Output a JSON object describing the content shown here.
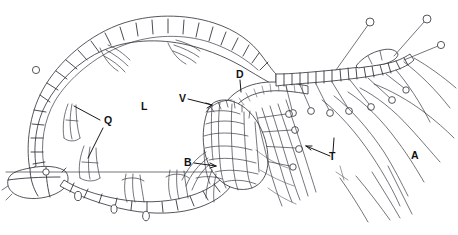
{
  "figure": {
    "background_color": "#ffffff",
    "ink_color": "#2b2b33",
    "label_color": "#101014",
    "width": 458,
    "height": 235
  },
  "labels": [
    {
      "key": "Q",
      "text": "Q",
      "x": 104,
      "y": 122,
      "description": "paired appendages on cell wall (two leader lines)"
    },
    {
      "key": "L",
      "text": "L",
      "x": 143,
      "y": 103,
      "description": "lumen / central cavity"
    },
    {
      "key": "D",
      "text": "D",
      "x": 236,
      "y": 72,
      "description": "dorsal cell band"
    },
    {
      "key": "V",
      "text": "V",
      "x": 180,
      "y": 95,
      "description": "ventral cell cluster"
    },
    {
      "key": "B",
      "text": "B",
      "x": 185,
      "y": 158,
      "description": "basal appendage group"
    },
    {
      "key": "T",
      "text": "T",
      "x": 330,
      "y": 152,
      "description": "trichome bundle"
    },
    {
      "key": "A",
      "text": "A",
      "x": 412,
      "y": 151,
      "description": "apical filaments"
    }
  ],
  "structures": {
    "cell_chain": "rounded rectangular epidermal cells forming a closed loop",
    "central_mass": "dense polygonal cell cluster with radiating stalked glands",
    "stalked_glands": "knob-tipped bristles along upper cell chain",
    "filaments": "long tapering curved filaments at lower right"
  }
}
